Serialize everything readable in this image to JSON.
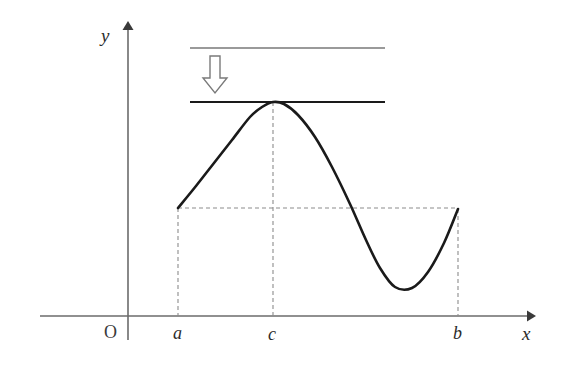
{
  "figure": {
    "background_color": "#ffffff",
    "axis_color": "#6b6b6b",
    "curve_color": "#1a1a1a",
    "upper_line_color": "#9a9a9a",
    "tangent_line_color": "#1a1a1a",
    "dashed_color": "#8c8c8c",
    "arrow_outline_color": "#707070"
  },
  "labels": {
    "y_axis": "y",
    "x_axis": "x",
    "origin": "O",
    "a": "a",
    "c": "c",
    "b": "b"
  },
  "chart_data": {
    "type": "line",
    "title": "",
    "xlabel": "x",
    "ylabel": "y",
    "grid": false,
    "legend": null,
    "xlim": [
      128,
      533
    ],
    "ylim": [
      316,
      22
    ],
    "axes": {
      "x_axis": {
        "y": 316,
        "x_start": 40,
        "x_end": 533,
        "arrow": "right"
      },
      "y_axis": {
        "x": 128,
        "y_start": 316,
        "y_end": 22,
        "arrow": "up"
      },
      "origin": {
        "x": 128,
        "y": 316
      }
    },
    "tick_labels": [
      {
        "text": "a",
        "x": 178
      },
      {
        "text": "c",
        "x": 273
      },
      {
        "text": "b",
        "x": 458
      }
    ],
    "series": [
      {
        "name": "curve",
        "points": [
          [
            178,
            208
          ],
          [
            196,
            186
          ],
          [
            214,
            163
          ],
          [
            232,
            140
          ],
          [
            250,
            117
          ],
          [
            262,
            107
          ],
          [
            273,
            102
          ],
          [
            284,
            104
          ],
          [
            298,
            115
          ],
          [
            315,
            137
          ],
          [
            332,
            167
          ],
          [
            350,
            204
          ],
          [
            366,
            240
          ],
          [
            380,
            268
          ],
          [
            395,
            287
          ],
          [
            412,
            288
          ],
          [
            428,
            272
          ],
          [
            444,
            243
          ],
          [
            458,
            209
          ]
        ],
        "key_points": {
          "left_endpoint": [
            178,
            208
          ],
          "maximum": [
            273,
            102
          ],
          "minimum": [
            395,
            287
          ],
          "right_endpoint": [
            458,
            209
          ]
        }
      }
    ],
    "annotations": [
      {
        "name": "upper-guide-line",
        "type": "horizontal-line",
        "y": 48,
        "x_start": 190,
        "x_end": 385,
        "style": "solid",
        "color": "#9a9a9a"
      },
      {
        "name": "tangent-line",
        "type": "horizontal-line",
        "y": 102,
        "x_start": 190,
        "x_end": 385,
        "style": "solid",
        "color": "#1a1a1a"
      },
      {
        "name": "down-arrow",
        "type": "hollow-arrow",
        "direction": "down",
        "x": 215,
        "y_start": 56,
        "y_end": 92
      },
      {
        "name": "endpoint-level-line",
        "type": "horizontal-dashed",
        "y": 208,
        "x_start": 178,
        "x_end": 458
      },
      {
        "name": "drop-line-a",
        "type": "vertical-dashed",
        "x": 178,
        "y_start": 208,
        "y_end": 316
      },
      {
        "name": "drop-line-c",
        "type": "vertical-dashed",
        "x": 273,
        "y_start": 102,
        "y_end": 316
      },
      {
        "name": "drop-line-b",
        "type": "vertical-dashed",
        "x": 458,
        "y_start": 209,
        "y_end": 316
      }
    ]
  }
}
